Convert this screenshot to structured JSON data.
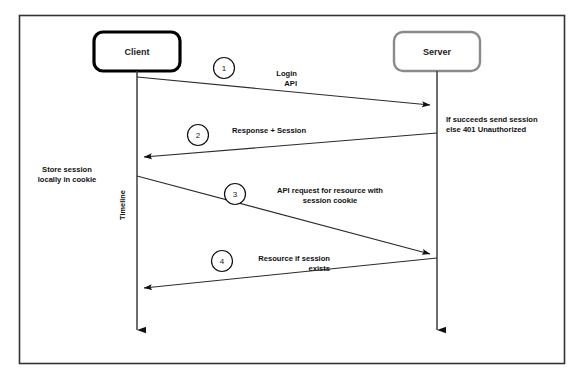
{
  "diagram": {
    "type": "sequence-diagram",
    "frame": {
      "border_color": "#333333",
      "background": "#ffffff"
    },
    "participants": [
      {
        "id": "client",
        "label": "Client",
        "border_color": "#000000",
        "lifeline_x": 137
      },
      {
        "id": "server",
        "label": "Server",
        "border_color": "#8a8a8a",
        "lifeline_x": 437
      }
    ],
    "timeline_label": "Timeline",
    "messages": [
      {
        "number": "1",
        "label_line1": "Login",
        "label_line2": "API",
        "from": "client",
        "to": "server",
        "direction": "right"
      },
      {
        "number": "2",
        "label_line1": "Response + Session",
        "label_line2": "",
        "from": "server",
        "to": "client",
        "direction": "left"
      },
      {
        "number": "3",
        "label_line1": "API request for resource with",
        "label_line2": "session cookie",
        "from": "client",
        "to": "server",
        "direction": "right"
      },
      {
        "number": "4",
        "label_line1": "Resource if session",
        "label_line2": "exists",
        "from": "server",
        "to": "client",
        "direction": "left"
      }
    ],
    "notes": [
      {
        "id": "server-note",
        "line1": "If succeeds send session",
        "line2": "else 401 Unauthorized",
        "side": "right"
      },
      {
        "id": "client-note",
        "line1": "Store session",
        "line2": "locally in cookie",
        "side": "left"
      }
    ]
  }
}
